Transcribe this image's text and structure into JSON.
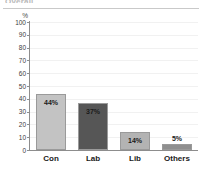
{
  "header": {
    "cut_off_title": "Overall",
    "has_rule": true
  },
  "chart_data": {
    "type": "bar",
    "title": "",
    "subtitle": "",
    "xlabel": "",
    "ylabel": "%",
    "ylim": [
      0,
      100
    ],
    "yticks": [
      "100",
      "90",
      "80",
      "70",
      "60",
      "50",
      "40",
      "30",
      "20",
      "10",
      "0"
    ],
    "grid": true,
    "legend": "none",
    "categories": [
      "Con",
      "Lab",
      "Lib",
      "Others"
    ],
    "values": [
      44,
      37,
      14,
      5
    ],
    "data_labels": [
      "44%",
      "37%",
      "14%",
      "5%"
    ],
    "label_positions": [
      "inside",
      "inside",
      "inside",
      "outside"
    ],
    "colors": [
      "#c3c3c3",
      "#565656",
      "#b3b3b3",
      "#8f8f8f"
    ],
    "bar_border_color": "#9a9a9a",
    "axis_color": "#8d8d8d",
    "gridline_color": "#f1f1f1",
    "background": "#ffffff"
  }
}
